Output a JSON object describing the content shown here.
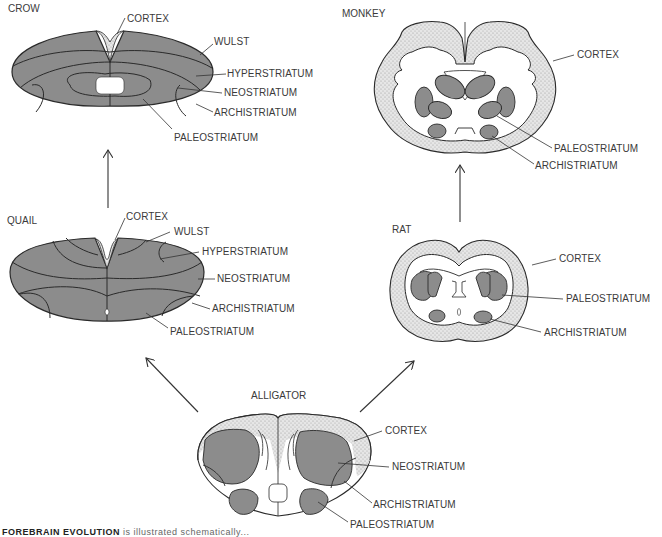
{
  "figure": {
    "panels": {
      "crow": {
        "title": "CROW",
        "labels": [
          "CORTEX",
          "WULST",
          "HYPERSTRIATUM",
          "NEOSTRIATUM",
          "ARCHISTRIATUM",
          "PALEOSTRIATUM"
        ]
      },
      "quail": {
        "title": "QUAIL",
        "labels": [
          "CORTEX",
          "WULST",
          "HYPERSTRIATUM",
          "NEOSTRIATUM",
          "ARCHISTRIATUM",
          "PALEOSTRIATUM"
        ]
      },
      "monkey": {
        "title": "MONKEY",
        "labels": [
          "CORTEX",
          "PALEOSTRIATUM",
          "ARCHISTRIATUM"
        ]
      },
      "rat": {
        "title": "RAT",
        "labels": [
          "CORTEX",
          "PALEOSTRIATUM",
          "ARCHISTRIATUM"
        ]
      },
      "alligator": {
        "title": "ALLIGATOR",
        "labels": [
          "CORTEX",
          "NEOSTRIATUM",
          "ARCHISTRIATUM",
          "PALEOSTRIATUM"
        ]
      }
    },
    "arrows": [
      {
        "from": "alligator",
        "to": "quail"
      },
      {
        "from": "alligator",
        "to": "rat"
      },
      {
        "from": "quail",
        "to": "crow"
      },
      {
        "from": "rat",
        "to": "monkey"
      }
    ],
    "caption": {
      "bold": "FOREBRAIN EVOLUTION",
      "rest": " is illustrated schematically..."
    },
    "colors": {
      "striatum_fill": "#8c8c8c",
      "cortex_stipple": "#dcdcdc",
      "outline": "#2a2a2a",
      "background": "#ffffff"
    }
  }
}
